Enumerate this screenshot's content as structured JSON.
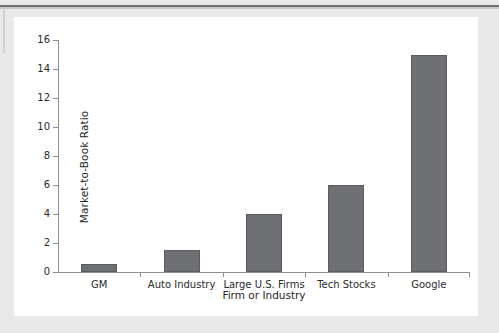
{
  "figure": {
    "background_color": "#e9e9e9",
    "card_color": "#ffffff",
    "rule_color": "#6f7275"
  },
  "chart_data": {
    "type": "bar",
    "title": "",
    "xlabel": "Firm or Industry",
    "ylabel": "Market-to-Book Ratio",
    "categories": [
      "GM",
      "Auto Industry",
      "Large U.S. Firms",
      "Tech Stocks",
      "Google"
    ],
    "values": [
      0.55,
      1.5,
      4.0,
      6.0,
      15.0
    ],
    "ylim": [
      0,
      16
    ],
    "ytick_labels": [
      "0",
      "2",
      "4",
      "6",
      "8",
      "10",
      "12",
      "14",
      "16"
    ],
    "ytick_values": [
      0,
      2,
      4,
      6,
      8,
      10,
      12,
      14,
      16
    ],
    "grid": false,
    "legend": false,
    "bar_color": "#6e7073",
    "bar_edge_color": "#595b5e",
    "axis_color": "#8d9093"
  }
}
